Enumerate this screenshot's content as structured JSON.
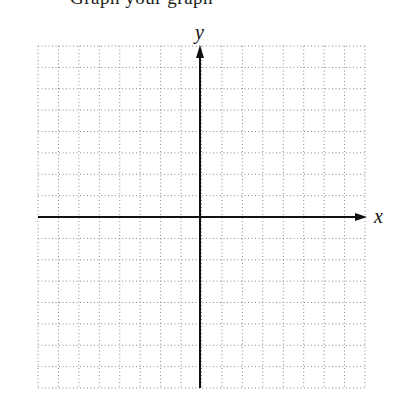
{
  "header": {
    "clipped_text": "Graph your graph"
  },
  "graph": {
    "x_axis_label": "x",
    "y_axis_label": "y",
    "columns": 16,
    "rows": 16,
    "origin_column": 8,
    "origin_row": 8,
    "grid_style": "dotted",
    "grid_color": "#8a8a8a",
    "axis_color": "#111111"
  }
}
